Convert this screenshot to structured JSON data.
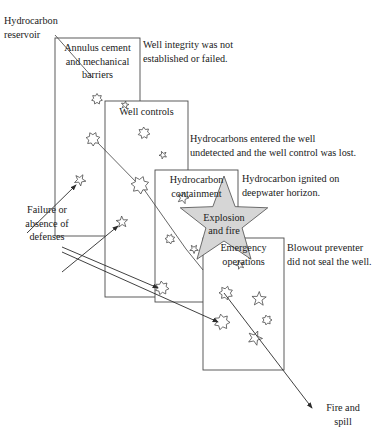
{
  "diagram": {
    "type": "swiss-cheese-barrier-model",
    "title_present": false,
    "colors": {
      "stroke": "#4a4a4a",
      "slice_fill": "#ffffff",
      "explosion_fill": "#d6d6d6",
      "arrow": "#2b2b2b",
      "text": "#1a1a1a"
    }
  },
  "slices": [
    {
      "id": "annulus",
      "label": "Annulus cement\nand mechanical\nbarriers",
      "box": {
        "x": 55,
        "y": 38,
        "w": 85,
        "h": 198
      }
    },
    {
      "id": "well-controls",
      "label": "Well controls",
      "box": {
        "x": 105,
        "y": 101,
        "w": 83,
        "h": 196
      }
    },
    {
      "id": "hydrocarbon-containment",
      "label": "Hydrocarbon\ncontainment",
      "box": {
        "x": 155,
        "y": 170,
        "w": 83,
        "h": 132
      }
    },
    {
      "id": "emergency-operations",
      "label": "Emergency\noperations",
      "box": {
        "x": 203,
        "y": 238,
        "w": 81,
        "h": 132
      }
    }
  ],
  "annotations": [
    {
      "id": "hydrocarbon-reservoir",
      "text": "Hydrocarbon\nreservoir",
      "align": "left"
    },
    {
      "id": "well-integrity",
      "text": "Well integrity was not\nestablished or failed.",
      "align": "left"
    },
    {
      "id": "hydrocarbons-entered",
      "text": "Hydrocarbons entered the well\nundetected and the well control was lost.",
      "align": "left"
    },
    {
      "id": "hydrocarbon-ignited",
      "text": "Hydrocarbon ignited on\ndeepwater horizon.",
      "align": "left"
    },
    {
      "id": "blowout-preventer",
      "text": "Blowout preventer\ndid not seal the well.",
      "align": "left"
    },
    {
      "id": "failure-absence",
      "text": "Failure or\nabsence of\ndefenses",
      "align": "center"
    },
    {
      "id": "fire-and-spill",
      "text": "Fire and\nspill",
      "align": "center"
    }
  ],
  "explosion": {
    "label": "Explosion\nand fire"
  },
  "holes": [
    {
      "slice": "annulus",
      "cx": 97,
      "cy": 99,
      "r": 5.5,
      "shape": "star-outline"
    },
    {
      "slice": "annulus",
      "cx": 125,
      "cy": 105,
      "r": 4.0,
      "shape": "star-outline"
    },
    {
      "slice": "annulus",
      "cx": 93,
      "cy": 139,
      "r": 7.0,
      "shape": "star-outline"
    },
    {
      "slice": "annulus",
      "cx": 80,
      "cy": 180,
      "r": 6.0,
      "shape": "star-outline"
    },
    {
      "slice": "well-controls",
      "cx": 144,
      "cy": 133,
      "r": 6.0,
      "shape": "star-outline"
    },
    {
      "slice": "well-controls",
      "cx": 163,
      "cy": 155,
      "r": 4.0,
      "shape": "star-outline"
    },
    {
      "slice": "well-controls",
      "cx": 140,
      "cy": 185,
      "r": 9.0,
      "shape": "star-outline"
    },
    {
      "slice": "well-controls",
      "cx": 122,
      "cy": 222,
      "r": 6.0,
      "shape": "star-outline"
    },
    {
      "slice": "well-controls",
      "cx": 162,
      "cy": 288,
      "r": 7.0,
      "shape": "star-outline"
    },
    {
      "slice": "hydrocarbon-containment",
      "cx": 183,
      "cy": 198,
      "r": 6.0,
      "shape": "star-outline"
    },
    {
      "slice": "hydrocarbon-containment",
      "cx": 170,
      "cy": 239,
      "r": 5.0,
      "shape": "star-outline"
    },
    {
      "slice": "hydrocarbon-containment",
      "cx": 194,
      "cy": 249,
      "r": 4.5,
      "shape": "star-outline"
    },
    {
      "slice": "hydrocarbon-containment",
      "cx": 222,
      "cy": 322,
      "r": 8.0,
      "shape": "star-outline"
    },
    {
      "slice": "emergency-operations",
      "cx": 240,
      "cy": 265,
      "r": 4.5,
      "shape": "star-outline"
    },
    {
      "slice": "emergency-operations",
      "cx": 226,
      "cy": 293,
      "r": 7.0,
      "shape": "star-outline"
    },
    {
      "slice": "emergency-operations",
      "cx": 259,
      "cy": 299,
      "r": 7.5,
      "shape": "star-outline"
    },
    {
      "slice": "emergency-operations",
      "cx": 267,
      "cy": 320,
      "r": 5.0,
      "shape": "star-outline"
    },
    {
      "slice": "emergency-operations",
      "cx": 255,
      "cy": 338,
      "r": 7.5,
      "shape": "star-outline"
    }
  ],
  "arrows": [
    {
      "id": "reservoir-pointer",
      "from": [
        55,
        35
      ],
      "to": [
        93,
        78
      ],
      "head": false
    },
    {
      "id": "annulus-to-wellcontrols",
      "from": [
        96,
        141
      ],
      "to": [
        139,
        185
      ],
      "head": false
    },
    {
      "id": "failure-to-annulus-hole",
      "from": [
        27,
        233
      ],
      "to": [
        76,
        185
      ],
      "head": true
    },
    {
      "id": "failure-to-wellcontrols-hole",
      "from": [
        62,
        272
      ],
      "to": [
        118,
        226
      ],
      "head": true
    },
    {
      "id": "wellcontrols-to-containment",
      "from": [
        143,
        188
      ],
      "to": [
        186,
        249
      ],
      "head": false
    },
    {
      "id": "failure-to-containment-hole",
      "from": [
        62,
        247
      ],
      "to": [
        158,
        288
      ],
      "head": true
    },
    {
      "id": "failure-to-emergency-hole",
      "from": [
        62,
        252
      ],
      "to": [
        218,
        322
      ],
      "head": true
    },
    {
      "id": "explosion-to-hole",
      "from": [
        186,
        249
      ],
      "to": [
        203,
        270
      ],
      "head": false
    },
    {
      "id": "emergency-to-fire",
      "from": [
        224,
        293
      ],
      "to": [
        312,
        408
      ],
      "head": true
    }
  ]
}
